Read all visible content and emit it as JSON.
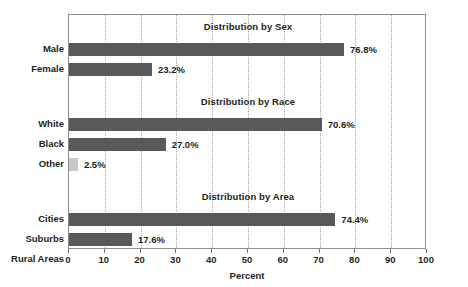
{
  "chart_data": {
    "type": "bar",
    "orientation": "horizontal",
    "title": "",
    "xlabel": "Percent",
    "ylabel": "",
    "xlim": [
      0,
      100
    ],
    "xticks": [
      0,
      10,
      20,
      30,
      40,
      50,
      60,
      70,
      80,
      90,
      100
    ],
    "xtick_labels": [
      "0",
      "10",
      "20",
      "30",
      "40",
      "50",
      "60",
      "70",
      "80",
      "90",
      "100"
    ],
    "grid": "vertical-dotted",
    "legend": "none",
    "colors": {
      "bar_dark": "#595959",
      "bar_light": "#c9c9c9",
      "text": "#231f20",
      "frame": "#8c8c8c",
      "gridline": "#a9a9a9",
      "background": "#ffffff"
    },
    "panels": [
      {
        "title": "Distribution by Sex",
        "categories": [
          "Male",
          "Female"
        ],
        "values": [
          76.8,
          23.2
        ],
        "value_labels": [
          "76.8%",
          "23.2%"
        ],
        "shades": [
          "dark",
          "dark"
        ]
      },
      {
        "title": "Distribution by Race",
        "categories": [
          "White",
          "Black",
          "Other"
        ],
        "values": [
          70.6,
          27.0,
          2.5
        ],
        "value_labels": [
          "70.6%",
          "27.0%",
          "2.5%"
        ],
        "shades": [
          "dark",
          "dark",
          "light"
        ]
      },
      {
        "title": "Distribution by Area",
        "categories": [
          "Cities",
          "Suburbs",
          "Rural Areas"
        ],
        "values": [
          74.4,
          17.6,
          8.0
        ],
        "value_labels": [
          "74.4%",
          "17.6%",
          "8%"
        ],
        "shades": [
          "dark",
          "dark",
          "light"
        ]
      }
    ]
  }
}
